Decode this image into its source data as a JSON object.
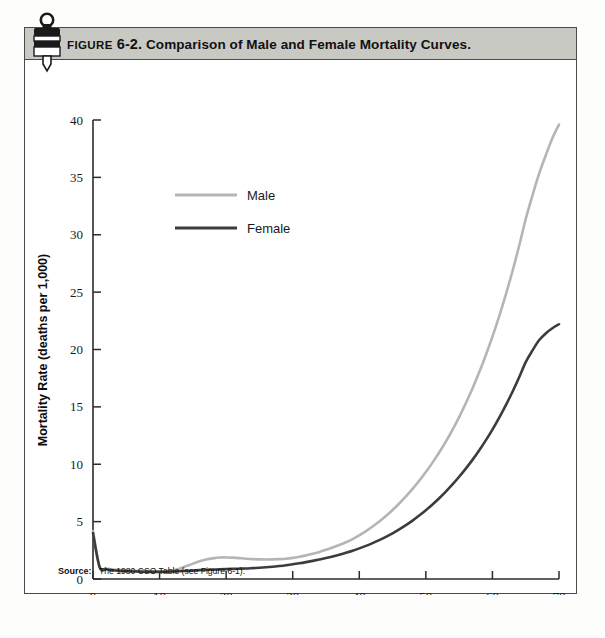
{
  "figure": {
    "label_word": "FIGURE",
    "number": "6-2.",
    "caption": "Comparison of Male and Female Mortality Curves.",
    "icon_name": "bookmark-tag-icon"
  },
  "source": {
    "label": "Source:",
    "text": "The 1980 CSO Table (see Figure 6-1)."
  },
  "colors": {
    "male_line": "#b5b5b5",
    "female_line": "#3c3c3c",
    "axis": "#2b2b2b",
    "caption_bar": "#c9c9c4",
    "figure_border": "#4a4a48",
    "page_background": "#ffffff"
  },
  "chart_data": {
    "type": "line",
    "title": "Comparison of Male and Female Mortality Curves.",
    "xlabel": "Age",
    "ylabel": "Mortality Rate (deaths per 1,000)",
    "xlim": [
      0,
      70
    ],
    "ylim": [
      0,
      40
    ],
    "xticks": [
      0,
      10,
      20,
      30,
      40,
      50,
      60,
      70
    ],
    "yticks": [
      0,
      5,
      10,
      15,
      20,
      25,
      30,
      35,
      40
    ],
    "xtick_labels": [
      "0",
      "10",
      "20",
      "30",
      "40",
      "50",
      "60",
      "70"
    ],
    "ytick_labels": [
      "0",
      "5",
      "10",
      "15",
      "20",
      "25",
      "30",
      "35",
      "40"
    ],
    "grid": false,
    "legend_position": "upper-left-inside",
    "x": [
      0,
      1,
      2,
      3,
      4,
      5,
      6,
      7,
      8,
      9,
      10,
      11,
      12,
      13,
      14,
      15,
      16,
      17,
      18,
      19,
      20,
      21,
      22,
      23,
      24,
      25,
      26,
      27,
      28,
      29,
      30,
      31,
      32,
      33,
      34,
      35,
      36,
      37,
      38,
      39,
      40,
      41,
      42,
      43,
      44,
      45,
      46,
      47,
      48,
      49,
      50,
      51,
      52,
      53,
      54,
      55,
      56,
      57,
      58,
      59,
      60,
      61,
      62,
      63,
      64,
      65,
      66,
      67,
      68,
      69,
      70
    ],
    "series": [
      {
        "name": "Male",
        "color": "#b5b5b5",
        "values": [
          4.18,
          1.06,
          0.91,
          0.83,
          0.79,
          0.76,
          0.73,
          0.72,
          0.7,
          0.68,
          0.67,
          0.69,
          0.76,
          0.9,
          1.12,
          1.34,
          1.54,
          1.7,
          1.8,
          1.87,
          1.88,
          1.86,
          1.82,
          1.77,
          1.73,
          1.71,
          1.7,
          1.71,
          1.73,
          1.77,
          1.84,
          1.94,
          2.06,
          2.2,
          2.36,
          2.54,
          2.74,
          2.96,
          3.2,
          3.48,
          3.8,
          4.17,
          4.57,
          5.01,
          5.49,
          6.01,
          6.58,
          7.19,
          7.85,
          8.56,
          9.32,
          10.14,
          11.02,
          11.97,
          13.0,
          14.11,
          15.31,
          16.6,
          17.99,
          19.5,
          21.12,
          22.87,
          24.76,
          26.8,
          29.0,
          31.37,
          33.4,
          35.3,
          36.9,
          38.4,
          39.6
        ]
      },
      {
        "name": "Female",
        "color": "#3c3c3c",
        "values": [
          4.0,
          1.02,
          0.85,
          0.76,
          0.71,
          0.68,
          0.66,
          0.64,
          0.63,
          0.62,
          0.62,
          0.63,
          0.65,
          0.68,
          0.71,
          0.74,
          0.77,
          0.8,
          0.82,
          0.84,
          0.86,
          0.88,
          0.9,
          0.92,
          0.95,
          0.98,
          1.02,
          1.07,
          1.13,
          1.2,
          1.28,
          1.37,
          1.47,
          1.58,
          1.7,
          1.83,
          1.97,
          2.12,
          2.29,
          2.47,
          2.67,
          2.89,
          3.13,
          3.39,
          3.67,
          3.98,
          4.32,
          4.69,
          5.09,
          5.53,
          6.0,
          6.5,
          7.04,
          7.62,
          8.24,
          8.91,
          9.62,
          10.38,
          11.2,
          12.08,
          13.02,
          14.04,
          15.13,
          16.3,
          17.56,
          18.9,
          19.9,
          20.8,
          21.4,
          21.85,
          22.2
        ]
      }
    ],
    "legend": [
      {
        "label": "Male",
        "color": "#b5b5b5"
      },
      {
        "label": "Female",
        "color": "#3c3c3c"
      }
    ]
  }
}
